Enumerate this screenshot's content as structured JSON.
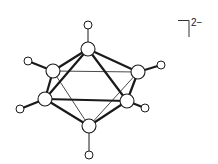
{
  "diagram": {
    "type": "chemical-structure",
    "charge_label": "2−",
    "colors": {
      "line": "#1a1a1a",
      "atom_fill": "#ffffff"
    },
    "boron_atoms": [
      {
        "id": "top",
        "x": 88,
        "y": 49,
        "r": 7
      },
      {
        "id": "upper-left",
        "x": 53,
        "y": 71,
        "r": 7
      },
      {
        "id": "upper-right",
        "x": 138,
        "y": 72,
        "r": 7
      },
      {
        "id": "lower-left",
        "x": 45,
        "y": 99,
        "r": 7
      },
      {
        "id": "lower-right",
        "x": 127,
        "y": 101,
        "r": 7
      },
      {
        "id": "bottom",
        "x": 89,
        "y": 126,
        "r": 7
      }
    ],
    "hydrogen_atoms": [
      {
        "id": "h-top",
        "x": 88,
        "y": 25,
        "r": 4
      },
      {
        "id": "h-upper-left",
        "x": 28,
        "y": 61,
        "r": 4
      },
      {
        "id": "h-upper-right",
        "x": 161,
        "y": 65,
        "r": 4
      },
      {
        "id": "h-lower-left",
        "x": 20,
        "y": 109,
        "r": 4
      },
      {
        "id": "h-lower-right",
        "x": 145,
        "y": 108,
        "r": 4
      },
      {
        "id": "h-bottom",
        "x": 89,
        "y": 155,
        "r": 4
      }
    ]
  }
}
